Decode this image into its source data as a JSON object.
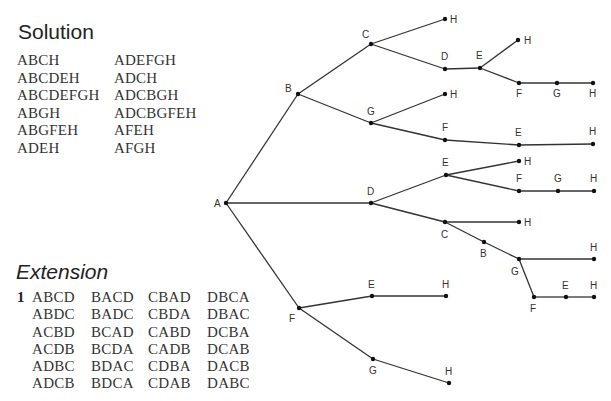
{
  "solution": {
    "title": "Solution",
    "col1": [
      "ABCH",
      "ABCDEH",
      "ABCDEFGH",
      "ABGH",
      "ABGFEH",
      "ADEH"
    ],
    "col2": [
      "ADEFGH",
      "ADCH",
      "ADCBGH",
      "ADCBGFEH",
      "AFEH",
      "AFGH"
    ]
  },
  "extension": {
    "title": "Extension",
    "number": "1",
    "columns": [
      [
        "ABCD",
        "ABDC",
        "ACBD",
        "ACDB",
        "ADBC",
        "ADCB"
      ],
      [
        "BACD",
        "BADC",
        "BCAD",
        "BCDA",
        "BDAC",
        "BDCA"
      ],
      [
        "CBAD",
        "CBDA",
        "CABD",
        "CADB",
        "CDBA",
        "CDAB"
      ],
      [
        "DBCA",
        "DBAC",
        "DCBA",
        "DCAB",
        "DACB",
        "DABC"
      ]
    ]
  },
  "tree": {
    "nodes": [
      {
        "id": "A",
        "label": "A",
        "x": 226,
        "y": 203,
        "lx": -12,
        "ly": 4
      },
      {
        "id": "B",
        "label": "B",
        "x": 298,
        "y": 94,
        "lx": -13,
        "ly": -2
      },
      {
        "id": "C1",
        "label": "C",
        "x": 371,
        "y": 44,
        "lx": -9,
        "ly": -6
      },
      {
        "id": "H1",
        "label": "H",
        "x": 445,
        "y": 19,
        "lx": 5,
        "ly": 4
      },
      {
        "id": "D1",
        "label": "D",
        "x": 445,
        "y": 69,
        "lx": -4,
        "ly": -9
      },
      {
        "id": "E1",
        "label": "E",
        "x": 480,
        "y": 68,
        "lx": -4,
        "ly": -9
      },
      {
        "id": "H2",
        "label": "H",
        "x": 518,
        "y": 40,
        "lx": 6,
        "ly": 4
      },
      {
        "id": "F1",
        "label": "F",
        "x": 519,
        "y": 83,
        "lx": -3,
        "ly": 14
      },
      {
        "id": "G1",
        "label": "G",
        "x": 557,
        "y": 83,
        "lx": -4,
        "ly": 14
      },
      {
        "id": "H3",
        "label": "H",
        "x": 593,
        "y": 83,
        "lx": -4,
        "ly": 14
      },
      {
        "id": "G2",
        "label": "G",
        "x": 371,
        "y": 123,
        "lx": -4,
        "ly": -8
      },
      {
        "id": "H4",
        "label": "H",
        "x": 445,
        "y": 94,
        "lx": 5,
        "ly": 4
      },
      {
        "id": "F2",
        "label": "F",
        "x": 445,
        "y": 140,
        "lx": -3,
        "ly": -9
      },
      {
        "id": "E2",
        "label": "E",
        "x": 519,
        "y": 145,
        "lx": -4,
        "ly": -9
      },
      {
        "id": "H5",
        "label": "H",
        "x": 593,
        "y": 144,
        "lx": -4,
        "ly": -9
      },
      {
        "id": "D2",
        "label": "D",
        "x": 371,
        "y": 203,
        "lx": -4,
        "ly": -8
      },
      {
        "id": "E3",
        "label": "E",
        "x": 446,
        "y": 175,
        "lx": -4,
        "ly": -9
      },
      {
        "id": "H6",
        "label": "H",
        "x": 519,
        "y": 161,
        "lx": 5,
        "ly": 4
      },
      {
        "id": "F3",
        "label": "F",
        "x": 519,
        "y": 191,
        "lx": -3,
        "ly": -9
      },
      {
        "id": "G3",
        "label": "G",
        "x": 558,
        "y": 191,
        "lx": -4,
        "ly": -9
      },
      {
        "id": "H7",
        "label": "H",
        "x": 594,
        "y": 191,
        "lx": -4,
        "ly": -9
      },
      {
        "id": "C2",
        "label": "C",
        "x": 445,
        "y": 222,
        "lx": -4,
        "ly": 16
      },
      {
        "id": "H8",
        "label": "H",
        "x": 519,
        "y": 222,
        "lx": 5,
        "ly": 4
      },
      {
        "id": "B2",
        "label": "B",
        "x": 484,
        "y": 242,
        "lx": -4,
        "ly": 15
      },
      {
        "id": "G4",
        "label": "G",
        "x": 519,
        "y": 259,
        "lx": -8,
        "ly": 16
      },
      {
        "id": "H9",
        "label": "H",
        "x": 594,
        "y": 259,
        "lx": -4,
        "ly": -8
      },
      {
        "id": "F4",
        "label": "F",
        "x": 534,
        "y": 297,
        "lx": -4,
        "ly": 15
      },
      {
        "id": "E4",
        "label": "E",
        "x": 566,
        "y": 297,
        "lx": -4,
        "ly": -8
      },
      {
        "id": "H10",
        "label": "H",
        "x": 594,
        "y": 297,
        "lx": -4,
        "ly": -8
      },
      {
        "id": "F5",
        "label": "F",
        "x": 299,
        "y": 308,
        "lx": -10,
        "ly": 14
      },
      {
        "id": "E5",
        "label": "E",
        "x": 372,
        "y": 296,
        "lx": -4,
        "ly": -8
      },
      {
        "id": "H11",
        "label": "H",
        "x": 446,
        "y": 296,
        "lx": -4,
        "ly": -8
      },
      {
        "id": "G5",
        "label": "G",
        "x": 373,
        "y": 359,
        "lx": -4,
        "ly": 15
      },
      {
        "id": "H12",
        "label": "H",
        "x": 449,
        "y": 383,
        "lx": -4,
        "ly": -8
      }
    ],
    "edges": [
      [
        "A",
        "B"
      ],
      [
        "B",
        "C1"
      ],
      [
        "C1",
        "H1"
      ],
      [
        "C1",
        "D1"
      ],
      [
        "D1",
        "E1"
      ],
      [
        "E1",
        "H2"
      ],
      [
        "E1",
        "F1"
      ],
      [
        "F1",
        "G1"
      ],
      [
        "G1",
        "H3"
      ],
      [
        "B",
        "G2"
      ],
      [
        "G2",
        "H4"
      ],
      [
        "G2",
        "F2"
      ],
      [
        "F2",
        "E2"
      ],
      [
        "E2",
        "H5"
      ],
      [
        "A",
        "D2"
      ],
      [
        "D2",
        "E3"
      ],
      [
        "E3",
        "H6"
      ],
      [
        "E3",
        "F3"
      ],
      [
        "F3",
        "G3"
      ],
      [
        "G3",
        "H7"
      ],
      [
        "D2",
        "C2"
      ],
      [
        "C2",
        "H8"
      ],
      [
        "C2",
        "B2"
      ],
      [
        "B2",
        "G4"
      ],
      [
        "G4",
        "H9"
      ],
      [
        "G4",
        "F4"
      ],
      [
        "F4",
        "E4"
      ],
      [
        "E4",
        "H10"
      ],
      [
        "A",
        "F5"
      ],
      [
        "F5",
        "E5"
      ],
      [
        "E5",
        "H11"
      ],
      [
        "F5",
        "G5"
      ],
      [
        "G5",
        "H12"
      ]
    ]
  }
}
